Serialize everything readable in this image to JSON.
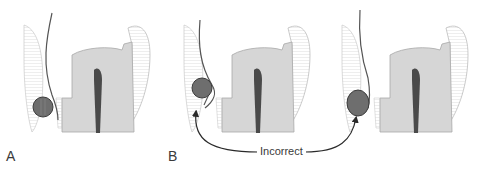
{
  "figure": {
    "panels": [
      {
        "id": "A",
        "label": "A",
        "offset_x": 0,
        "cord": "round",
        "status": "correct"
      },
      {
        "id": "B1",
        "label": "B",
        "offset_x": 160,
        "cord": "round-displaced",
        "status": "incorrect"
      },
      {
        "id": "B2",
        "label": "",
        "offset_x": 318,
        "cord": "oval-raised",
        "status": "incorrect"
      }
    ],
    "annotation": {
      "text": "Incorrect"
    },
    "colors": {
      "tooth": "#d6d6d6",
      "tooth_outline": "#9a9a9a",
      "pulp": "#4a4a4a",
      "cord": "#6e6e6e",
      "cord_outline": "#3c3c3c",
      "gingiva_hatch": "#b8b8b8",
      "line": "#555555",
      "arrow": "#2a2a2a"
    }
  }
}
